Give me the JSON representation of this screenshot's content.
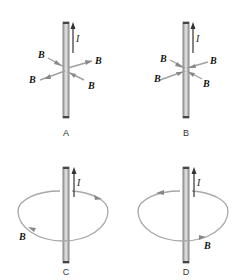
{
  "figure": {
    "current_symbol": "I",
    "field_symbol": "B",
    "panels": [
      {
        "id": "A",
        "caption": "A",
        "field_style": "radial",
        "arrow_pattern": "mixed",
        "b_labels": [
          "B",
          "B",
          "B",
          "B"
        ]
      },
      {
        "id": "B",
        "caption": "B",
        "field_style": "radial",
        "arrow_pattern": "inward",
        "b_labels": [
          "B",
          "B",
          "B",
          "B"
        ]
      },
      {
        "id": "C",
        "caption": "C",
        "field_style": "circular",
        "rotation": "clockwise-viewed-from-above",
        "b_labels": [
          "B"
        ]
      },
      {
        "id": "D",
        "caption": "D",
        "field_style": "circular",
        "rotation": "counterclockwise-viewed-from-above",
        "b_labels": [
          "B"
        ]
      }
    ],
    "colors": {
      "wire": "#9a9a9a",
      "wire_dark": "#555555",
      "field_line": "#a8a8a8",
      "arrow": "#444444",
      "text": "#111111"
    }
  }
}
